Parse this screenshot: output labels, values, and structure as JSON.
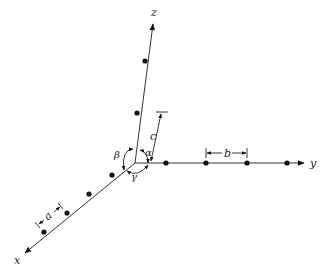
{
  "diagram": {
    "type": "crystal lattice axes",
    "axes": {
      "x": {
        "label": "x"
      },
      "y": {
        "label": "y"
      },
      "z": {
        "label": "z"
      }
    },
    "lattice_parameters": {
      "a": "a",
      "b": "b",
      "c": "c"
    },
    "angles": {
      "alpha": "α",
      "beta": "β",
      "gamma": "γ"
    },
    "lattice_points": {
      "x_axis": 4,
      "y_axis": 4,
      "z_axis": 2
    },
    "colors": {
      "line": "#333333",
      "point": "#111111",
      "background": "#ffffff"
    }
  }
}
